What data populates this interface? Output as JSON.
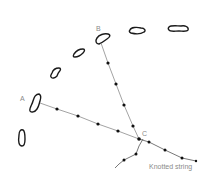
{
  "diagram": {
    "type": "surveying-sketch",
    "labels": {
      "point_a": "A",
      "point_b": "B",
      "point_c": "C",
      "string": "Knotted string"
    },
    "colors": {
      "stone_outline": "#1a1a1a",
      "string_line": "#8c8c8c",
      "knot": "#111111",
      "label_text": "#8a8a8a"
    },
    "stones": [
      {
        "id": "stone-b",
        "near": "B"
      },
      {
        "id": "stone-2"
      },
      {
        "id": "stone-3"
      },
      {
        "id": "stone-4"
      },
      {
        "id": "stone-5"
      },
      {
        "id": "stone-a",
        "near": "A"
      },
      {
        "id": "stone-7"
      }
    ],
    "lines": [
      {
        "id": "line-a-c",
        "from": "A",
        "to": "C",
        "knots": 4
      },
      {
        "id": "line-b-c",
        "from": "B",
        "to": "C",
        "knots": 4
      },
      {
        "id": "knotted-string",
        "from": "C",
        "knots": 3
      },
      {
        "id": "branch-string",
        "from": "C",
        "knots": 2
      }
    ]
  }
}
